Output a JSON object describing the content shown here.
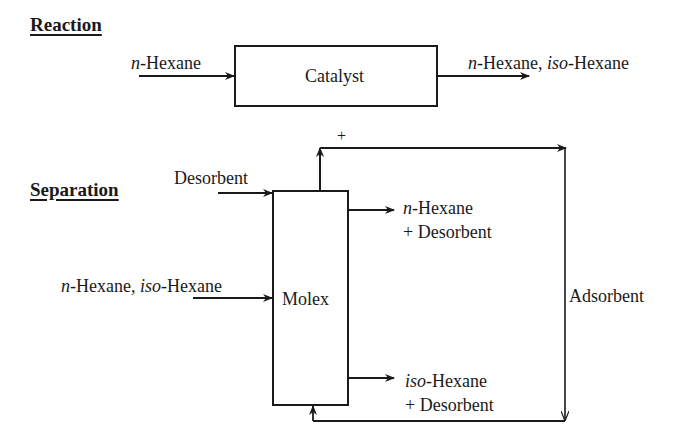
{
  "reaction": {
    "heading": "Reaction",
    "input": {
      "prefix": "n",
      "suffix": "-Hexane"
    },
    "unit": "Catalyst",
    "output": {
      "part1_prefix": "n",
      "part1_suffix": "-Hexane, ",
      "part2_prefix": "iso",
      "part2_suffix": "-Hexane"
    }
  },
  "separation": {
    "heading": "Separation",
    "desorbent_input": "Desorbent",
    "feed": {
      "part1_prefix": "n",
      "part1_suffix": "-Hexane, ",
      "part2_prefix": "iso",
      "part2_suffix": "-Hexane"
    },
    "unit": "Molex",
    "product_top": {
      "line1_prefix": "n",
      "line1_suffix": "-Hexane",
      "line2": "+ Desorbent"
    },
    "product_bottom": {
      "line1_prefix": "iso",
      "line1_suffix": "-Hexane",
      "line2": "+ Desorbent"
    },
    "recycle_sign": "+",
    "recycle_label": "Adsorbent"
  },
  "colors": {
    "line": "#1a1a1a",
    "background": "#ffffff"
  }
}
